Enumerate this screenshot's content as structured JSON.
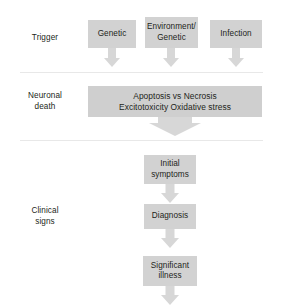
{
  "diagram": {
    "colors": {
      "node_fill": "#d2d2d2",
      "wide_node_fill": "#cfcfcf",
      "arrow_fill": "#d7d7d7",
      "divider": "#e8e8e8",
      "text": "#231f20",
      "background": "#ffffff"
    },
    "stages": [
      {
        "id": "trigger",
        "label": "Trigger",
        "nodes": [
          {
            "id": "genetic",
            "text": "Genetic"
          },
          {
            "id": "environment-genetic",
            "text": "Environment/\nGenetic"
          },
          {
            "id": "infection",
            "text": "Infection"
          }
        ]
      },
      {
        "id": "neuronal-death",
        "label": "Neuronal\ndeath",
        "nodes": [
          {
            "id": "mechanisms",
            "text": "Apoptosis vs Necrosis\nExcitotoxicity Oxidative stress"
          }
        ]
      },
      {
        "id": "clinical-signs",
        "label": "Clinical\nsigns",
        "nodes": [
          {
            "id": "initial-symptoms",
            "text": "Initial\nsymptoms"
          },
          {
            "id": "diagnosis",
            "text": "Diagnosis"
          },
          {
            "id": "significant-illness",
            "text": "Significant\nillness"
          }
        ]
      }
    ]
  }
}
